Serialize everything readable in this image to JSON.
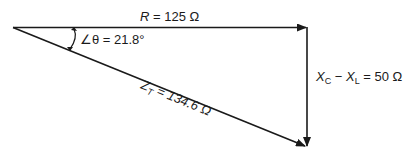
{
  "diagram": {
    "type": "impedance-triangle",
    "resistance": {
      "symbol": "R",
      "value": "125",
      "unit": "Ω",
      "label": "R = 125 Ω"
    },
    "reactance": {
      "symbol": "X",
      "sub1": "C",
      "sub2": "L",
      "value": "50",
      "unit": "Ω",
      "label": "XC − XL = 50 Ω"
    },
    "impedance": {
      "symbol": "Z",
      "sub": "T",
      "value": "134.6",
      "unit": "Ω",
      "label": "ZT = 134.6 Ω"
    },
    "angle": {
      "symbol": "∠θ",
      "value": "21.8",
      "unit": "°",
      "label": "∠θ = 21.8°"
    },
    "colors": {
      "line": "#1a1a1a",
      "background": "#ffffff"
    }
  },
  "text": {
    "r_sym": "R",
    "r_rest": " = 125 Ω",
    "x_sym": "X",
    "x_sub1": "C",
    "x_mid": " − ",
    "x_sym2": "X",
    "x_sub2": "L",
    "x_rest": " = 50 Ω",
    "z_sym": "Z",
    "z_sub": "T",
    "z_rest": " = 134.6 Ω",
    "angle": "∠θ = 21.8°"
  }
}
